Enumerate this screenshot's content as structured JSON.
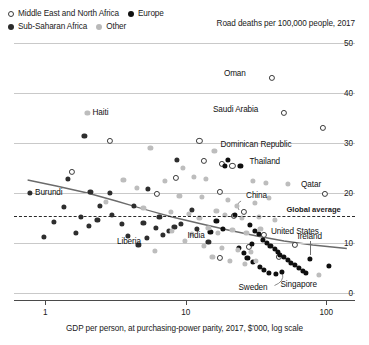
{
  "legend": {
    "items": [
      {
        "label": "Middle East and North Africa",
        "marker": "open-circle",
        "color": "#ffffff"
      },
      {
        "label": "Europe",
        "marker": "filled-circle",
        "color": "#111111"
      },
      {
        "label": "Sub-Saharan Africa",
        "marker": "filled-circle",
        "color": "#2e2e2e"
      },
      {
        "label": "Other",
        "marker": "filled-circle",
        "color": "#bdbdbd"
      }
    ]
  },
  "chart_data": {
    "type": "scatter",
    "title": "Road deaths per 100,000 people, 2017",
    "xlabel": "GDP per person, at purchasing-power parity, 2017, $'000, log scale",
    "ylabel": "Road deaths per 100,000 people, 2017",
    "xscale": "log",
    "xlim": [
      0.6,
      160
    ],
    "ylim": [
      0,
      50
    ],
    "xticks": [
      "1",
      "10",
      "100"
    ],
    "xtick_values": [
      1,
      10,
      100
    ],
    "yticks": [
      "0",
      "10",
      "20",
      "30",
      "40",
      "50"
    ],
    "ytick_values": [
      0,
      10,
      20,
      30,
      40,
      50
    ],
    "grid": true,
    "y_axis_position": "right",
    "legend_position": "top-left",
    "global_average": {
      "label": "Global average",
      "value": 15.5
    },
    "trendline": {
      "type": "loess",
      "description": "downward sloping fit from ~22 at low GDP to ~9 at high GDP"
    },
    "series": [
      {
        "name": "Middle East and North Africa",
        "marker": "open-circle",
        "color": "#ffffff",
        "points": [
          {
            "x": 41.0,
            "y": 43.0,
            "label": "Oman"
          },
          {
            "x": 50.0,
            "y": 36.0,
            "label": "Saudi Arabia"
          },
          {
            "x": 95.0,
            "y": 33.0,
            "label": ""
          },
          {
            "x": 12.5,
            "y": 30.5,
            "label": ""
          },
          {
            "x": 2.9,
            "y": 30.5,
            "label": ""
          },
          {
            "x": 13.5,
            "y": 26.5,
            "label": ""
          },
          {
            "x": 18.0,
            "y": 25.8,
            "label": ""
          },
          {
            "x": 21.5,
            "y": 25.4,
            "label": ""
          },
          {
            "x": 1.55,
            "y": 24.2,
            "label": ""
          },
          {
            "x": 8.5,
            "y": 23.0,
            "label": ""
          },
          {
            "x": 6.2,
            "y": 19.8,
            "label": ""
          },
          {
            "x": 17.5,
            "y": 20.2,
            "label": ""
          },
          {
            "x": 26.0,
            "y": 16.2,
            "label": "China"
          },
          {
            "x": 98.0,
            "y": 19.8,
            "label": "Qatar"
          },
          {
            "x": 22.0,
            "y": 15.5,
            "label": ""
          },
          {
            "x": 36.0,
            "y": 11.7,
            "label": "United States"
          },
          {
            "x": 60.0,
            "y": 9.6,
            "label": ""
          },
          {
            "x": 28.0,
            "y": 9.2,
            "label": ""
          },
          {
            "x": 17.5,
            "y": 7.0,
            "label": ""
          },
          {
            "x": 46.0,
            "y": 7.2,
            "label": ""
          }
        ]
      },
      {
        "name": "Sub-Saharan Africa",
        "marker": "filled-circle",
        "color": "#2e2e2e",
        "points": [
          {
            "x": 1.9,
            "y": 31.5,
            "label": ""
          },
          {
            "x": 8.7,
            "y": 26.7,
            "label": ""
          },
          {
            "x": 1.45,
            "y": 22.8,
            "label": ""
          },
          {
            "x": 0.78,
            "y": 20.0,
            "label": "Burundi"
          },
          {
            "x": 2.1,
            "y": 20.2,
            "label": ""
          },
          {
            "x": 2.9,
            "y": 20.1,
            "label": ""
          },
          {
            "x": 5.4,
            "y": 20.8,
            "label": ""
          },
          {
            "x": 1.35,
            "y": 17.2,
            "label": ""
          },
          {
            "x": 2.45,
            "y": 17.4,
            "label": ""
          },
          {
            "x": 4.3,
            "y": 17.4,
            "label": ""
          },
          {
            "x": 3.0,
            "y": 15.6,
            "label": ""
          },
          {
            "x": 1.8,
            "y": 15.2,
            "label": ""
          },
          {
            "x": 2.35,
            "y": 14.7,
            "label": ""
          },
          {
            "x": 1.15,
            "y": 14.2,
            "label": ""
          },
          {
            "x": 2.05,
            "y": 13.4,
            "label": ""
          },
          {
            "x": 3.5,
            "y": 13.8,
            "label": ""
          },
          {
            "x": 5.0,
            "y": 14.1,
            "label": ""
          },
          {
            "x": 6.5,
            "y": 15.2,
            "label": ""
          },
          {
            "x": 6.1,
            "y": 13.0,
            "label": ""
          },
          {
            "x": 1.65,
            "y": 12.0,
            "label": ""
          },
          {
            "x": 3.9,
            "y": 11.5,
            "label": ""
          },
          {
            "x": 0.98,
            "y": 11.3,
            "label": ""
          },
          {
            "x": 5.3,
            "y": 11.0,
            "label": "Liberia"
          },
          {
            "x": 6.9,
            "y": 11.6,
            "label": ""
          },
          {
            "x": 7.6,
            "y": 12.5,
            "label": ""
          },
          {
            "x": 8.3,
            "y": 13.2,
            "label": ""
          },
          {
            "x": 9.2,
            "y": 13.9,
            "label": ""
          },
          {
            "x": 4.6,
            "y": 9.6,
            "label": ""
          },
          {
            "x": 12.0,
            "y": 12.8,
            "label": ""
          },
          {
            "x": 14.5,
            "y": 10.2,
            "label": ""
          },
          {
            "x": 11.0,
            "y": 16.6,
            "label": ""
          }
        ]
      },
      {
        "name": "Europe",
        "marker": "filled-circle",
        "color": "#111111",
        "points": [
          {
            "x": 22.5,
            "y": 15.6,
            "label": ""
          },
          {
            "x": 20.0,
            "y": 26.6,
            "label": ""
          },
          {
            "x": 24.5,
            "y": 25.4,
            "label": "Thailand"
          },
          {
            "x": 19.0,
            "y": 25.5,
            "label": ""
          },
          {
            "x": 28.5,
            "y": 13.6,
            "label": ""
          },
          {
            "x": 31.0,
            "y": 12.5,
            "label": ""
          },
          {
            "x": 33.0,
            "y": 11.9,
            "label": ""
          },
          {
            "x": 35.5,
            "y": 10.6,
            "label": ""
          },
          {
            "x": 38.0,
            "y": 10.0,
            "label": ""
          },
          {
            "x": 40.0,
            "y": 9.4,
            "label": ""
          },
          {
            "x": 43.0,
            "y": 8.9,
            "label": ""
          },
          {
            "x": 45.0,
            "y": 8.2,
            "label": ""
          },
          {
            "x": 47.0,
            "y": 7.6,
            "label": ""
          },
          {
            "x": 50.0,
            "y": 7.2,
            "label": ""
          },
          {
            "x": 53.0,
            "y": 6.6,
            "label": ""
          },
          {
            "x": 56.0,
            "y": 6.1,
            "label": ""
          },
          {
            "x": 60.0,
            "y": 5.6,
            "label": ""
          },
          {
            "x": 64.0,
            "y": 5.0,
            "label": ""
          },
          {
            "x": 68.0,
            "y": 4.5,
            "label": ""
          },
          {
            "x": 72.0,
            "y": 4.1,
            "label": ""
          },
          {
            "x": 48.0,
            "y": 4.3,
            "label": "Sweden"
          },
          {
            "x": 44.0,
            "y": 3.8,
            "label": ""
          },
          {
            "x": 39.0,
            "y": 4.0,
            "label": ""
          },
          {
            "x": 36.0,
            "y": 4.6,
            "label": ""
          },
          {
            "x": 33.5,
            "y": 5.2,
            "label": ""
          },
          {
            "x": 30.0,
            "y": 6.2,
            "label": ""
          },
          {
            "x": 27.5,
            "y": 7.0,
            "label": ""
          },
          {
            "x": 26.0,
            "y": 8.0,
            "label": ""
          },
          {
            "x": 24.0,
            "y": 9.0,
            "label": ""
          },
          {
            "x": 29.5,
            "y": 9.8,
            "label": ""
          },
          {
            "x": 76.0,
            "y": 6.8,
            "label": "Ireland"
          },
          {
            "x": 105.0,
            "y": 5.4,
            "label": ""
          },
          {
            "x": 16.5,
            "y": 14.4,
            "label": ""
          },
          {
            "x": 15.0,
            "y": 12.2,
            "label": ""
          },
          {
            "x": 18.5,
            "y": 12.9,
            "label": ""
          }
        ]
      },
      {
        "name": "Other",
        "marker": "filled-circle",
        "color": "#bdbdbd",
        "points": [
          {
            "x": 2.0,
            "y": 36.0,
            "label": "Haiti"
          },
          {
            "x": 16.0,
            "y": 28.5,
            "label": "Dominican Republic"
          },
          {
            "x": 5.6,
            "y": 29.0,
            "label": ""
          },
          {
            "x": 9.5,
            "y": 25.0,
            "label": ""
          },
          {
            "x": 11.5,
            "y": 23.2,
            "label": ""
          },
          {
            "x": 3.6,
            "y": 22.6,
            "label": ""
          },
          {
            "x": 7.1,
            "y": 22.4,
            "label": ""
          },
          {
            "x": 14.0,
            "y": 22.9,
            "label": ""
          },
          {
            "x": 30.0,
            "y": 22.4,
            "label": ""
          },
          {
            "x": 37.0,
            "y": 22.0,
            "label": ""
          },
          {
            "x": 53.0,
            "y": 21.9,
            "label": ""
          },
          {
            "x": 4.5,
            "y": 21.0,
            "label": ""
          },
          {
            "x": 9.0,
            "y": 19.5,
            "label": ""
          },
          {
            "x": 13.0,
            "y": 19.3,
            "label": ""
          },
          {
            "x": 20.0,
            "y": 18.6,
            "label": ""
          },
          {
            "x": 23.0,
            "y": 17.5,
            "label": ""
          },
          {
            "x": 31.0,
            "y": 18.0,
            "label": ""
          },
          {
            "x": 39.0,
            "y": 19.0,
            "label": ""
          },
          {
            "x": 2.7,
            "y": 18.2,
            "label": ""
          },
          {
            "x": 5.0,
            "y": 17.0,
            "label": ""
          },
          {
            "x": 7.8,
            "y": 16.3,
            "label": ""
          },
          {
            "x": 10.5,
            "y": 15.9,
            "label": ""
          },
          {
            "x": 12.5,
            "y": 15.0,
            "label": ""
          },
          {
            "x": 16.5,
            "y": 16.5,
            "label": ""
          },
          {
            "x": 19.0,
            "y": 15.7,
            "label": ""
          },
          {
            "x": 25.0,
            "y": 15.0,
            "label": ""
          },
          {
            "x": 33.0,
            "y": 15.3,
            "label": ""
          },
          {
            "x": 43.0,
            "y": 14.6,
            "label": ""
          },
          {
            "x": 14.5,
            "y": 13.0,
            "label": "India"
          },
          {
            "x": 8.0,
            "y": 12.4,
            "label": ""
          },
          {
            "x": 11.0,
            "y": 11.9,
            "label": ""
          },
          {
            "x": 17.0,
            "y": 12.1,
            "label": ""
          },
          {
            "x": 21.5,
            "y": 12.6,
            "label": ""
          },
          {
            "x": 27.0,
            "y": 12.0,
            "label": ""
          },
          {
            "x": 34.0,
            "y": 12.8,
            "label": ""
          },
          {
            "x": 9.8,
            "y": 10.4,
            "label": ""
          },
          {
            "x": 13.5,
            "y": 9.5,
            "label": ""
          },
          {
            "x": 18.0,
            "y": 9.0,
            "label": ""
          },
          {
            "x": 23.5,
            "y": 8.6,
            "label": ""
          },
          {
            "x": 29.0,
            "y": 8.2,
            "label": ""
          },
          {
            "x": 6.0,
            "y": 8.4,
            "label": ""
          },
          {
            "x": 15.5,
            "y": 7.2,
            "label": ""
          },
          {
            "x": 20.5,
            "y": 6.5,
            "label": ""
          },
          {
            "x": 88.0,
            "y": 3.6,
            "label": "Singapore"
          },
          {
            "x": 26.5,
            "y": 5.8,
            "label": ""
          },
          {
            "x": 31.5,
            "y": 6.4,
            "label": ""
          }
        ]
      }
    ],
    "annotations": [
      {
        "label": "Oman",
        "x": 41.0,
        "y": 43.0
      },
      {
        "label": "Saudi Arabia",
        "x": 50.0,
        "y": 36.0
      },
      {
        "label": "Haiti",
        "x": 2.0,
        "y": 36.0
      },
      {
        "label": "Dominican Republic",
        "x": 16.0,
        "y": 28.5
      },
      {
        "label": "Thailand",
        "x": 24.5,
        "y": 25.4
      },
      {
        "label": "China",
        "x": 26.0,
        "y": 16.2
      },
      {
        "label": "Qatar",
        "x": 98.0,
        "y": 19.8
      },
      {
        "label": "Burundi",
        "x": 0.78,
        "y": 20.0
      },
      {
        "label": "India",
        "x": 14.5,
        "y": 13.0
      },
      {
        "label": "United States",
        "x": 36.0,
        "y": 11.7
      },
      {
        "label": "Liberia",
        "x": 5.3,
        "y": 11.0
      },
      {
        "label": "Ireland",
        "x": 76.0,
        "y": 6.8
      },
      {
        "label": "Sweden",
        "x": 48.0,
        "y": 4.3
      },
      {
        "label": "Singapore",
        "x": 88.0,
        "y": 3.6
      },
      {
        "label": "Global average",
        "x": 0,
        "y": 15.5
      }
    ]
  }
}
